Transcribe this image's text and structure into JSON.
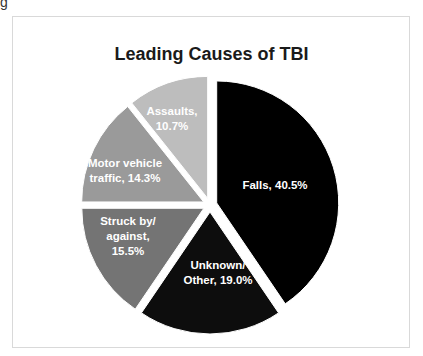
{
  "corner_text": "g",
  "chart": {
    "title": "Leading Causes of TBI",
    "labels": [
      {
        "lines": [
          "Falls, 40.5%"
        ]
      },
      {
        "lines": [
          "Unknown/",
          "Other, 19.0%"
        ]
      },
      {
        "lines": [
          "Struck by/",
          "against,",
          "15.5%"
        ]
      },
      {
        "lines": [
          "Motor vehicle",
          "traffic, 14.3%"
        ]
      },
      {
        "lines": [
          "Assaults,",
          "10.7%"
        ]
      }
    ]
  },
  "chart_data": {
    "type": "pie",
    "title": "Leading Causes of TBI",
    "categories": [
      "Falls",
      "Unknown/Other",
      "Struck by/against",
      "Motor vehicle traffic",
      "Assaults"
    ],
    "values": [
      40.5,
      19.0,
      15.5,
      14.3,
      10.7
    ],
    "unit": "%",
    "colors": [
      "#000000",
      "#0d0d0d",
      "#747474",
      "#9a9a9a",
      "#bdbdbd"
    ],
    "exploded": true,
    "start_angle": "12 o'clock, clockwise",
    "legend": "none (labels inside slices)"
  }
}
